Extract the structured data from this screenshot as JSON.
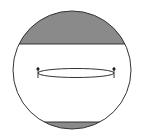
{
  "diagram": {
    "colors": {
      "background": "#ffffff",
      "outline": "#333333",
      "cap_fill": "#8a8a8a"
    },
    "sphere": {
      "cx": 72,
      "cy": 70,
      "r": 59
    },
    "top_cap": {
      "chord_y": 44
    },
    "bottom_cap": {
      "chord_y": 122
    },
    "slice_ellipse": {
      "cx": 76,
      "cy": 73,
      "rx": 38,
      "ry": 4.5
    },
    "markers": [
      {
        "x": 38,
        "y": 69
      },
      {
        "x": 114,
        "y": 69
      }
    ]
  }
}
